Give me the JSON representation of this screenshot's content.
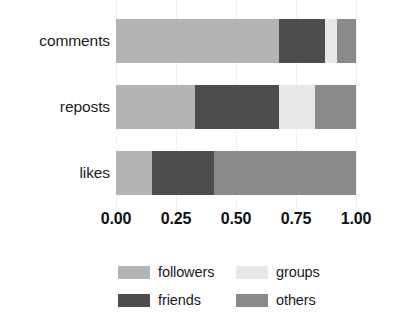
{
  "chart_data": {
    "type": "bar",
    "orientation": "horizontal",
    "stacked": true,
    "normalized": true,
    "title": "",
    "subtitle": "",
    "xlabel": "",
    "ylabel": "",
    "xlim": [
      0.0,
      1.0
    ],
    "grid": false,
    "legend_position": "bottom",
    "legend_columns": 2,
    "categories": [
      "comments",
      "reposts",
      "likes"
    ],
    "tick_labels": [
      "0.00",
      "0.25",
      "0.50",
      "0.75",
      "1.00"
    ],
    "tick_values": [
      0.0,
      0.25,
      0.5,
      0.75,
      1.0
    ],
    "series": [
      {
        "name": "followers",
        "color": "#b4b4b4",
        "values": [
          0.68,
          0.33,
          0.15
        ]
      },
      {
        "name": "friends",
        "color": "#4d4d4d",
        "values": [
          0.19,
          0.35,
          0.26
        ]
      },
      {
        "name": "groups",
        "color": "#e8e8e8",
        "values": [
          0.05,
          0.15,
          0.0
        ]
      },
      {
        "name": "others",
        "color": "#8a8a8a",
        "values": [
          0.08,
          0.17,
          0.59
        ]
      }
    ],
    "annotations": []
  },
  "legend": {
    "entries": [
      {
        "label": "followers",
        "color": "#b4b4b4"
      },
      {
        "label": "groups",
        "color": "#e8e8e8"
      },
      {
        "label": "friends",
        "color": "#4d4d4d"
      },
      {
        "label": "others",
        "color": "#8a8a8a"
      }
    ]
  }
}
